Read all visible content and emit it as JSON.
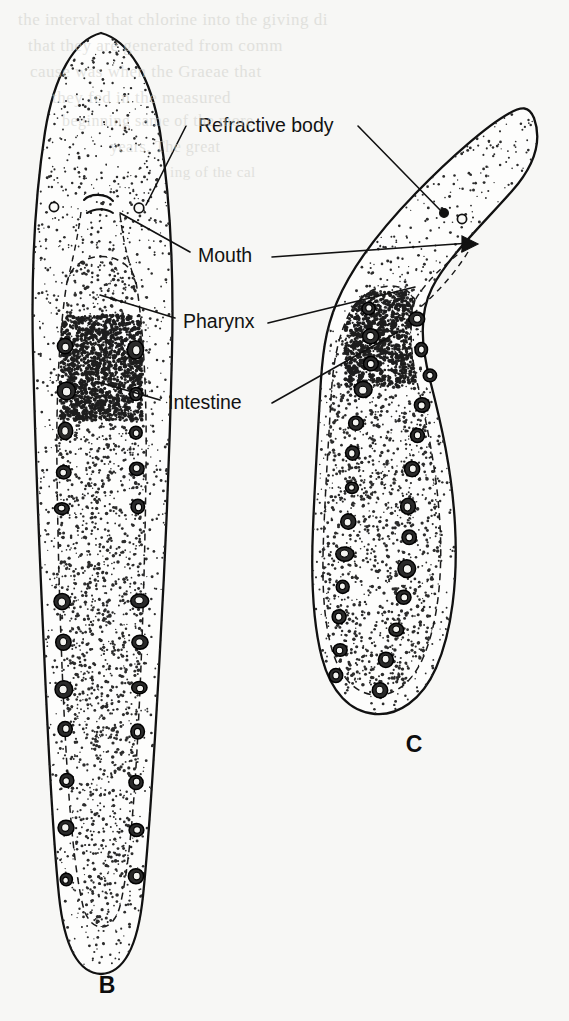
{
  "figure": {
    "background_color": "#f7f7f5",
    "ink_color": "#111111"
  },
  "annotations": [
    {
      "id": "refractive-body",
      "label": "Refractive body",
      "text_x": 198,
      "text_y": 132,
      "leaders": [
        {
          "target": "B",
          "points": "186,126 146,205"
        },
        {
          "target": "C",
          "points": "358,126 443,213"
        }
      ]
    },
    {
      "id": "mouth",
      "label": "Mouth",
      "text_x": 198,
      "text_y": 262,
      "leaders": [
        {
          "target": "B",
          "points": "190,252 120,213"
        },
        {
          "target": "C",
          "points": "272,257 470,243"
        }
      ]
    },
    {
      "id": "pharynx",
      "label": "Pharynx",
      "text_x": 183,
      "text_y": 328,
      "leaders": [
        {
          "target": "B",
          "points": "175,318 100,295"
        },
        {
          "target": "C",
          "points": "268,323 415,287"
        }
      ]
    },
    {
      "id": "intestine",
      "label": "Intestine",
      "text_x": 168,
      "text_y": 409,
      "leaders": [
        {
          "target": "B",
          "points": "160,400 98,382"
        },
        {
          "target": "C",
          "points": "272,403 398,332"
        }
      ]
    }
  ],
  "specimens": [
    {
      "id": "B",
      "plate_letter": "B",
      "letter_x": 107,
      "letter_y": 993,
      "orientation": "straight elongate",
      "structures": [
        "cilia",
        "mouth",
        "refractive body",
        "pharynx",
        "intestine",
        "intestinal nuclei"
      ],
      "nuclei_pairs": 12,
      "refractive_bodies": 2
    },
    {
      "id": "C",
      "plate_letter": "C",
      "letter_x": 414,
      "letter_y": 752,
      "orientation": "hooked / bent",
      "structures": [
        "cilia",
        "mouth",
        "refractive body",
        "pharynx",
        "intestine",
        "intestinal nuclei"
      ],
      "nuclei_pairs": 13,
      "refractive_bodies": 2
    }
  ],
  "background_bleed_text": [
    {
      "text": "the interval that chlorine into the giving di",
      "x": 18,
      "y": 10,
      "size": 17
    },
    {
      "text": "that they are generated from comm",
      "x": 28,
      "y": 36,
      "size": 17
    },
    {
      "text": "cause was when the Graeae that",
      "x": 30,
      "y": 62,
      "size": 17
    },
    {
      "text": "they fed in the measured",
      "x": 52,
      "y": 88,
      "size": 17
    },
    {
      "text": "beginning same of the more",
      "x": 62,
      "y": 112,
      "size": 16
    },
    {
      "text": "years. The great",
      "x": 110,
      "y": 138,
      "size": 16
    },
    {
      "text": "ing of the cal",
      "x": 170,
      "y": 164,
      "size": 15
    }
  ]
}
